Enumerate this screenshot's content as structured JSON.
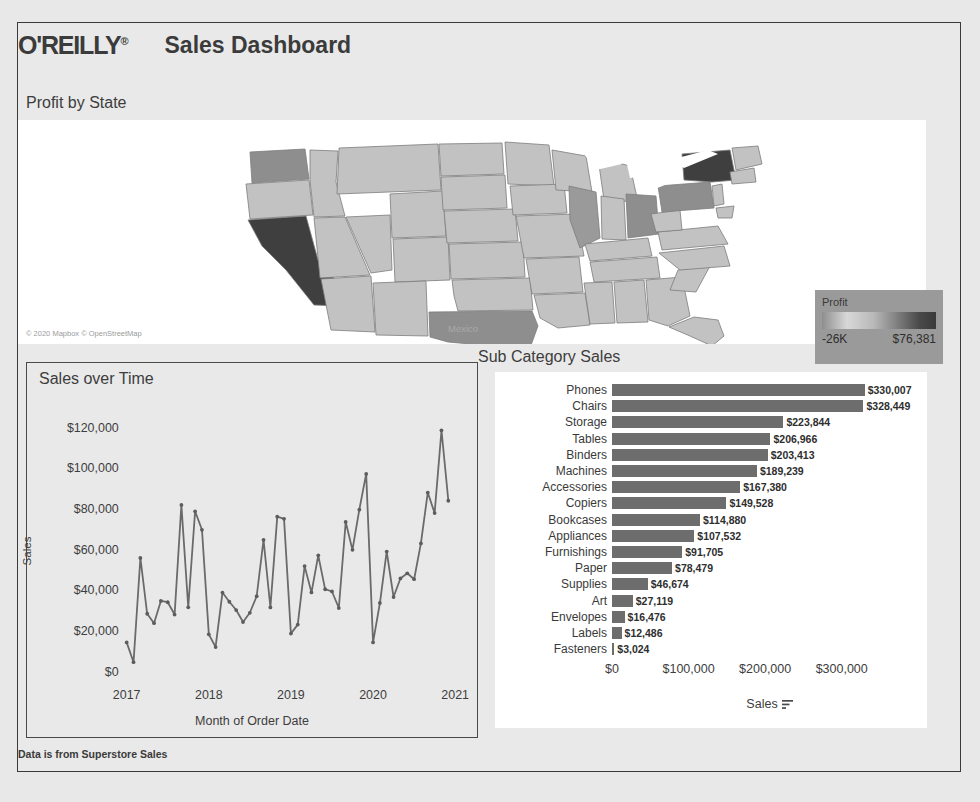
{
  "header": {
    "logo_text": "O'REILLY",
    "logo_mark": "®",
    "title": "Sales Dashboard"
  },
  "map_section": {
    "title": "Profit by State",
    "attribution": "© 2020 Mapbox © OpenStreetMap",
    "country_label": "Mexico",
    "legend": {
      "title": "Profit",
      "min_label": "-26K",
      "max_label": "$76,381"
    }
  },
  "footer": {
    "note": "Data is from Superstore Sales"
  },
  "time_chart": {
    "title": "Sales over Time"
  },
  "sub_chart": {
    "title": "Sub Category Sales",
    "sort_icon": "sort-descending-icon"
  },
  "chart_data": [
    {
      "type": "line",
      "title": "Sales over Time",
      "xlabel": "Month of Order Date",
      "ylabel": "Sales",
      "ylim": [
        0,
        130000
      ],
      "yticks": [
        0,
        20000,
        40000,
        60000,
        80000,
        100000,
        120000
      ],
      "ytick_labels": [
        "$0",
        "$20,000",
        "$40,000",
        "$60,000",
        "$80,000",
        "$100,000",
        "$120,000"
      ],
      "xtick_labels": [
        "2017",
        "2018",
        "2019",
        "2020",
        "2021"
      ],
      "grid": false,
      "legend": "none",
      "marker": "circle",
      "x": [
        "2017-01",
        "2017-02",
        "2017-03",
        "2017-04",
        "2017-05",
        "2017-06",
        "2017-07",
        "2017-08",
        "2017-09",
        "2017-10",
        "2017-11",
        "2017-12",
        "2018-01",
        "2018-02",
        "2018-03",
        "2018-04",
        "2018-05",
        "2018-06",
        "2018-07",
        "2018-08",
        "2018-09",
        "2018-10",
        "2018-11",
        "2018-12",
        "2019-01",
        "2019-02",
        "2019-03",
        "2019-04",
        "2019-05",
        "2019-06",
        "2019-07",
        "2019-08",
        "2019-09",
        "2019-10",
        "2019-11",
        "2019-12",
        "2020-01",
        "2020-02",
        "2020-03",
        "2020-04",
        "2020-05",
        "2020-06",
        "2020-07",
        "2020-08",
        "2020-09",
        "2020-10",
        "2020-11",
        "2020-12"
      ],
      "values": [
        14236,
        4520,
        55691,
        28295,
        23648,
        34595,
        33946,
        27909,
        81777,
        31453,
        78629,
        69545,
        18174,
        11951,
        38726,
        34196,
        30132,
        24220,
        28765,
        36898,
        64596,
        31404,
        75972,
        74920,
        18542,
        22979,
        51716,
        38750,
        56987,
        40344,
        39262,
        31115,
        73410,
        59688,
        79412,
        96999,
        14206,
        33585,
        58872,
        36522,
        45656,
        48190,
        45264,
        62838,
        87866,
        77777,
        118448,
        83829
      ]
    },
    {
      "type": "bar",
      "orientation": "horizontal",
      "title": "Sub Category Sales",
      "xlabel": "Sales",
      "ylabel": "",
      "xlim": [
        0,
        350000
      ],
      "xticks": [
        0,
        100000,
        200000,
        300000
      ],
      "xtick_labels": [
        "$0",
        "$100,000",
        "$200,000",
        "$300,000"
      ],
      "grid": false,
      "legend": "none",
      "bar_color": "#6d6d6d",
      "categories": [
        "Phones",
        "Chairs",
        "Storage",
        "Tables",
        "Binders",
        "Machines",
        "Accessories",
        "Copiers",
        "Bookcases",
        "Appliances",
        "Furnishings",
        "Paper",
        "Supplies",
        "Art",
        "Envelopes",
        "Labels",
        "Fasteners"
      ],
      "values": [
        330007,
        328449,
        223844,
        206966,
        203413,
        189239,
        167380,
        149528,
        114880,
        107532,
        91705,
        78479,
        46674,
        27119,
        16476,
        12486,
        3024
      ],
      "value_labels": [
        "$330,007",
        "$328,449",
        "$223,844",
        "$206,966",
        "$203,413",
        "$189,239",
        "$167,380",
        "$149,528",
        "$114,880",
        "$107,532",
        "$91,705",
        "$78,479",
        "$46,674",
        "$27,119",
        "$16,476",
        "$12,486",
        "$3,024"
      ]
    },
    {
      "type": "map",
      "subtype": "choropleth",
      "title": "Profit by State",
      "value_field": "Profit",
      "color_min": -26000,
      "color_max": 76381,
      "min_label": "-26K",
      "max_label": "$76,381",
      "highlighted_states": [
        {
          "state": "California",
          "level": "highest"
        },
        {
          "state": "New York",
          "level": "highest"
        },
        {
          "state": "Texas",
          "level": "low"
        },
        {
          "state": "Washington",
          "level": "high"
        },
        {
          "state": "Pennsylvania",
          "level": "low"
        },
        {
          "state": "Ohio",
          "level": "low"
        },
        {
          "state": "Illinois",
          "level": "mid"
        }
      ]
    }
  ]
}
